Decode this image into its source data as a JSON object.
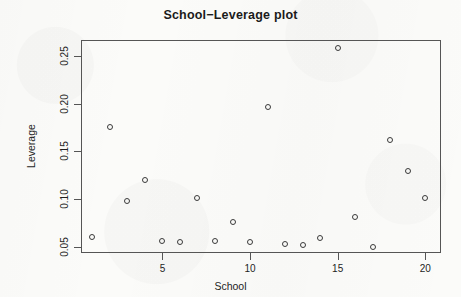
{
  "chart_data": {
    "type": "scatter",
    "title": "School−Leverage plot",
    "xlabel": "School",
    "ylabel": "Leverage",
    "grid": false,
    "legend": null,
    "xlim": [
      0.35,
      20.9
    ],
    "ylim": [
      0.0435,
      0.2665
    ],
    "xticks": [
      5,
      10,
      15,
      20
    ],
    "xtick_labels": [
      "5",
      "10",
      "15",
      "20"
    ],
    "yticks": [
      0.05,
      0.1,
      0.15,
      0.2,
      0.25
    ],
    "ytick_labels": [
      "0.05",
      "0.10",
      "0.15",
      "0.20",
      "0.25"
    ],
    "marker": "open-circle",
    "marker_color": "#3a3a3a",
    "x": [
      1,
      2,
      3,
      4,
      5,
      6,
      7,
      8,
      9,
      10,
      11,
      12,
      13,
      14,
      15,
      16,
      17,
      18,
      19,
      20
    ],
    "y": [
      0.06,
      0.175,
      0.098,
      0.12,
      0.056,
      0.055,
      0.101,
      0.056,
      0.076,
      0.055,
      0.196,
      0.053,
      0.052,
      0.059,
      0.258,
      0.081,
      0.05,
      0.162,
      0.129,
      0.101
    ],
    "points": [
      {
        "school": 1,
        "leverage": 0.06
      },
      {
        "school": 2,
        "leverage": 0.175
      },
      {
        "school": 3,
        "leverage": 0.098
      },
      {
        "school": 4,
        "leverage": 0.12
      },
      {
        "school": 5,
        "leverage": 0.056
      },
      {
        "school": 6,
        "leverage": 0.055
      },
      {
        "school": 7,
        "leverage": 0.101
      },
      {
        "school": 8,
        "leverage": 0.056
      },
      {
        "school": 9,
        "leverage": 0.076
      },
      {
        "school": 10,
        "leverage": 0.055
      },
      {
        "school": 11,
        "leverage": 0.196
      },
      {
        "school": 12,
        "leverage": 0.053
      },
      {
        "school": 13,
        "leverage": 0.052
      },
      {
        "school": 14,
        "leverage": 0.059
      },
      {
        "school": 15,
        "leverage": 0.258
      },
      {
        "school": 16,
        "leverage": 0.081
      },
      {
        "school": 17,
        "leverage": 0.05
      },
      {
        "school": 18,
        "leverage": 0.162
      },
      {
        "school": 19,
        "leverage": 0.129
      },
      {
        "school": 20,
        "leverage": 0.101
      }
    ]
  },
  "colors": {
    "axis": "#555555",
    "text": "#1e1e1e",
    "marker": "#3a3a3a",
    "background": "#fbfbf9"
  }
}
